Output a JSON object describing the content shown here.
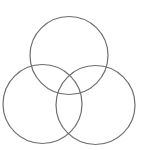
{
  "diagram": {
    "type": "venn",
    "set_count": 3,
    "stroke_color": "#6e6e6e",
    "fill_color": "none",
    "background": "#ffffff",
    "circles": [
      {
        "name": "top",
        "cx": 69,
        "cy": 55.5,
        "r": 39
      },
      {
        "name": "bottom-left",
        "cx": 42.5,
        "cy": 104,
        "r": 39.5
      },
      {
        "name": "bottom-right",
        "cx": 95.5,
        "cy": 105,
        "r": 39.5
      }
    ],
    "labels": []
  }
}
